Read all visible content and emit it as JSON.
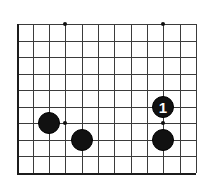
{
  "figure": {
    "kind": "go-board-diagram",
    "board_size": 19,
    "view": "cropped corner (lower-left)",
    "width_px": 214,
    "height_px": 185
  },
  "colors": {
    "background": "#ffffff",
    "grid_line": "#3b3b3b",
    "board_edge": "#1c1c1c",
    "star_point": "#111111",
    "black_stone": "#111111",
    "white_stone": "#ffffff",
    "black_stone_label": "#ffffff"
  },
  "grid": {
    "x_positions": [
      17,
      33,
      49,
      65,
      82,
      98,
      114,
      131,
      147,
      163,
      180,
      196
    ],
    "y_positions": [
      24,
      41,
      57,
      74,
      90,
      107,
      123,
      140,
      156,
      173
    ],
    "spacing_x": 16.3,
    "spacing_y": 16.5,
    "columns": 12,
    "rows": 10,
    "edges": {
      "left": true,
      "bottom": true,
      "top": false,
      "right": false
    }
  },
  "star_points": [
    {
      "name": "star-point-top-left",
      "x": 65,
      "y": 24
    },
    {
      "name": "star-point-top-right",
      "x": 163,
      "y": 24
    },
    {
      "name": "star-point-bottom-left",
      "x": 65,
      "y": 123
    },
    {
      "name": "star-point-bottom-right",
      "x": 163,
      "y": 123
    }
  ],
  "stones": [
    {
      "name": "stone-black-left-upper",
      "color": "black",
      "x": 49,
      "y": 123,
      "radius": 11,
      "label": ""
    },
    {
      "name": "stone-black-left-lower",
      "color": "black",
      "x": 82,
      "y": 140,
      "radius": 11,
      "label": ""
    },
    {
      "name": "stone-black-move-1",
      "color": "black",
      "x": 163,
      "y": 107,
      "radius": 11,
      "label": "1"
    },
    {
      "name": "stone-black-right-lower",
      "color": "black",
      "x": 163,
      "y": 140,
      "radius": 11,
      "label": ""
    }
  ]
}
